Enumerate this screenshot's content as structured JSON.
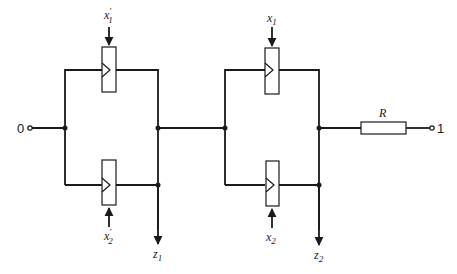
{
  "diagram": {
    "type": "relay-contact network",
    "terminals": {
      "input": "0",
      "output": "1"
    },
    "stage1": {
      "top_element": {
        "label": "x",
        "sub": "1",
        "prime": "′"
      },
      "bottom_element": {
        "label": "x",
        "sub": "2",
        "prime": "′"
      },
      "output": {
        "label": "z",
        "sub": "1"
      }
    },
    "stage2": {
      "top_element": {
        "label": "x",
        "sub": "1",
        "prime": ""
      },
      "bottom_element": {
        "label": "x",
        "sub": "2",
        "prime": ""
      },
      "output": {
        "label": "z",
        "sub": "2"
      }
    },
    "resistor": {
      "label": "R"
    },
    "colors": {
      "line": "#1a1a1a",
      "background": "#ffffff"
    }
  }
}
